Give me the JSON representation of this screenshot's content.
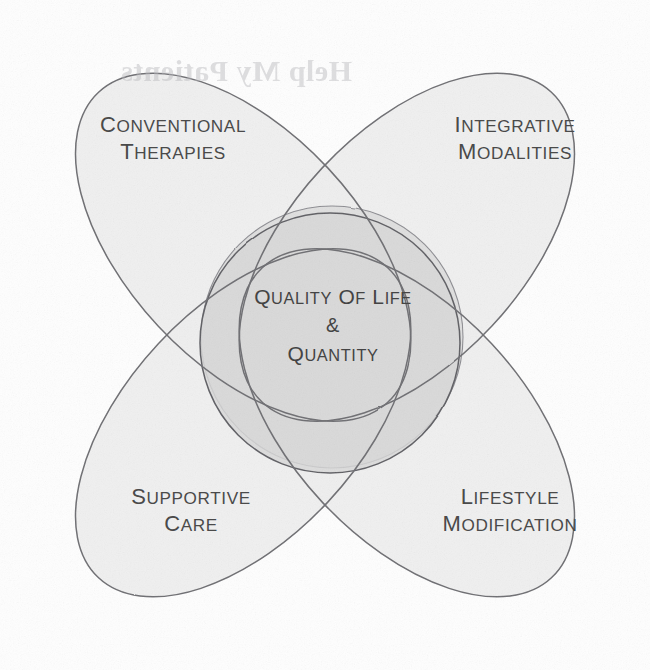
{
  "figure": {
    "type": "venn-quatrefoil",
    "canvas": {
      "width": 650,
      "height": 670
    }
  },
  "colors": {
    "page_background": "#fefefe",
    "petal_fill": "#efefef",
    "petal_stroke": "#6e6e72",
    "center_fill": "#d9d9d9",
    "center_stroke": "#5e5e62",
    "label_text": "#4a4a4a",
    "bleed_text": "#b9b9bd"
  },
  "petals": [
    {
      "id": "conventional-therapies",
      "position": "top-left",
      "label_lines": [
        "Conventional",
        "Therapies"
      ]
    },
    {
      "id": "integrative-modalities",
      "position": "top-right",
      "label_lines": [
        "Integrative",
        "Modalities"
      ]
    },
    {
      "id": "supportive-care",
      "position": "bottom-left",
      "label_lines": [
        "Supportive",
        "Care"
      ]
    },
    {
      "id": "lifestyle-modification",
      "position": "bottom-right",
      "label_lines": [
        "Lifestyle",
        "Modification"
      ]
    }
  ],
  "center": {
    "id": "quality-of-life-quantity",
    "label_lines": [
      "Quality of Life",
      "&",
      "Quantity"
    ]
  },
  "bleed_through": {
    "line1": "",
    "line2": "Help My Patients",
    "line3": ""
  },
  "chart_data": {
    "type": "venn",
    "title": "Quality of Life & Quantity",
    "sets": [
      "Conventional Therapies",
      "Integrative Modalities",
      "Supportive Care",
      "Lifestyle Modification"
    ],
    "intersection_label": "Quality of Life & Quantity",
    "set_count": 4,
    "legend": "none",
    "grid": false
  }
}
